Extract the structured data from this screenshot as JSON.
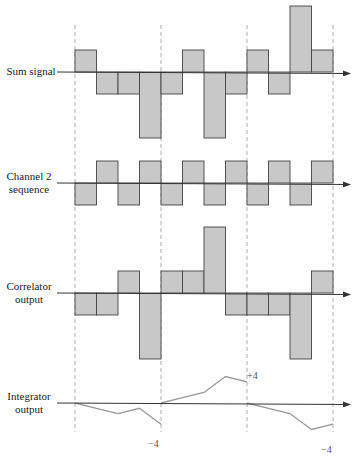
{
  "figure": {
    "colors": {
      "bar_fill": "#c8c8c8",
      "bar_stroke": "#444444",
      "axis": "#333333",
      "guide": "#999999",
      "integrator_line": "#999999"
    },
    "period_boundaries_x": [
      75,
      161,
      247,
      333
    ],
    "chip_width": 21.5,
    "chips_per_period": 4
  },
  "rows": [
    {
      "id": "sum-signal",
      "label_lines": [
        "Sum signal"
      ],
      "axis_y": 72,
      "unit_px": 22,
      "values": [
        1,
        -1,
        -1,
        -3,
        -1,
        1,
        -3,
        -1,
        1,
        -1,
        3,
        1
      ]
    },
    {
      "id": "channel-2-sequence",
      "label_lines": [
        "Channel 2",
        "sequence"
      ],
      "axis_y": 183,
      "unit_px": 22,
      "values": [
        -1,
        1,
        -1,
        1,
        -1,
        1,
        -1,
        1,
        -1,
        1,
        -1,
        1
      ]
    },
    {
      "id": "correlator-output",
      "label_lines": [
        "Correlator",
        "output"
      ],
      "axis_y": 293,
      "unit_px": 22,
      "values": [
        -1,
        -1,
        1,
        -3,
        1,
        1,
        3,
        -1,
        -1,
        -1,
        -3,
        1
      ]
    },
    {
      "id": "integrator-output",
      "label_lines": [
        "Integrator",
        "output"
      ],
      "axis_y": 403,
      "unit_px": 5.3,
      "segments": [
        [
          0,
          -1,
          -2,
          -1,
          -4
        ],
        [
          0,
          1,
          2,
          5,
          4
        ],
        [
          0,
          -1,
          -2,
          -5,
          -4
        ]
      ],
      "annotations": [
        "−4",
        "+4",
        "−4"
      ]
    }
  ],
  "labels": {
    "sum": [
      "Sum signal"
    ],
    "ch2": [
      "Channel 2",
      "sequence"
    ],
    "corr": [
      "Correlator",
      "output"
    ],
    "integ": [
      "Integrator",
      "output"
    ],
    "integ_end_1": "−4",
    "integ_end_2": "+4",
    "integ_end_3": "−4"
  },
  "chart_data": {
    "type": "bar",
    "title": "",
    "xlabel": "",
    "ylabel": "",
    "categories": [
      "c1",
      "c2",
      "c3",
      "c4",
      "c5",
      "c6",
      "c7",
      "c8",
      "c9",
      "c10",
      "c11",
      "c12"
    ],
    "series": [
      {
        "name": "Sum signal",
        "values": [
          1,
          -1,
          -1,
          -3,
          -1,
          1,
          -3,
          -1,
          1,
          -1,
          3,
          1
        ]
      },
      {
        "name": "Channel 2 sequence",
        "values": [
          -1,
          1,
          -1,
          1,
          -1,
          1,
          -1,
          1,
          -1,
          1,
          -1,
          1
        ]
      },
      {
        "name": "Correlator output",
        "values": [
          -1,
          -1,
          1,
          -3,
          1,
          1,
          3,
          -1,
          -1,
          -1,
          -3,
          1
        ]
      }
    ],
    "integrator_output": {
      "type": "line",
      "reset_each_bit": true,
      "bits": [
        {
          "points": [
            0,
            -1,
            -2,
            -1,
            -4
          ],
          "final": -4
        },
        {
          "points": [
            0,
            1,
            2,
            5,
            4
          ],
          "final": 4
        },
        {
          "points": [
            0,
            -1,
            -2,
            -5,
            -4
          ],
          "final": -4
        }
      ]
    },
    "grid": false,
    "legend": "none"
  }
}
